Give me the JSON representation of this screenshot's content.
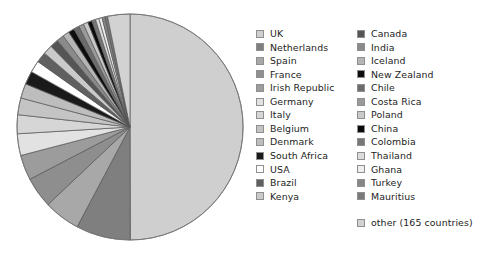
{
  "chart_data": {
    "type": "pie",
    "title": "",
    "subtitle": "",
    "xlabel": "",
    "ylabel": "",
    "grid": false,
    "legend_position": "right",
    "legend_columns": 2,
    "start_angle_deg": 0,
    "direction": "clockwise",
    "note": "Grayscale pie of visitor/export share by country. UK dominates at roughly half the circle; remaining countries fan counter-clockwise as progressively thinner slices.",
    "categories": [
      "UK",
      "Netherlands",
      "Spain",
      "France",
      "Irish Republic",
      "Germany",
      "Italy",
      "Belgium",
      "Denmark",
      "South Africa",
      "USA",
      "Brazil",
      "Kenya",
      "Canada",
      "India",
      "Iceland",
      "New Zealand",
      "Chile",
      "Costa Rica",
      "Poland",
      "China",
      "Colombia",
      "Thailand",
      "Ghana",
      "Turkey",
      "Mauritius",
      "other (165 countries)"
    ],
    "values": [
      50.0,
      7.8,
      5.2,
      4.4,
      3.6,
      3.1,
      2.7,
      2.4,
      2.1,
      1.9,
      1.7,
      1.5,
      1.35,
      1.2,
      1.05,
      0.95,
      0.85,
      0.8,
      0.72,
      0.66,
      0.6,
      0.55,
      0.5,
      0.46,
      0.42,
      0.38,
      3.19
    ],
    "colors": [
      "#cfcfcf",
      "#7f7f7f",
      "#a8a8a8",
      "#8e8e8e",
      "#9c9c9c",
      "#e2e2e2",
      "#d6d6d6",
      "#c4c4c4",
      "#bdbdbd",
      "#1a1a1a",
      "#ffffff",
      "#606060",
      "#cacaca",
      "#555555",
      "#8a8a8a",
      "#b5b5b5",
      "#0d0d0d",
      "#6b6b6b",
      "#9a9a9a",
      "#c9c9c9",
      "#0a0a0a",
      "#777777",
      "#dcdcdc",
      "#eeeeee",
      "#868686",
      "#7a7a7a",
      "#d2d2d2"
    ],
    "slice_border": "#555555",
    "legend_swatch_border": "#8f8f8f",
    "legend_text_color": "#1d1d1d",
    "background": "#ffffff"
  },
  "legend": {
    "column_1": [
      {
        "label": "UK",
        "color": "#cfcfcf"
      },
      {
        "label": "Netherlands",
        "color": "#7f7f7f"
      },
      {
        "label": "Spain",
        "color": "#a8a8a8"
      },
      {
        "label": "France",
        "color": "#8e8e8e"
      },
      {
        "label": "Irish Republic",
        "color": "#9c9c9c"
      },
      {
        "label": "Germany",
        "color": "#e2e2e2"
      },
      {
        "label": "Italy",
        "color": "#d6d6d6"
      },
      {
        "label": "Belgium",
        "color": "#c4c4c4"
      },
      {
        "label": "Denmark",
        "color": "#bdbdbd"
      },
      {
        "label": "South Africa",
        "color": "#1a1a1a"
      },
      {
        "label": "USA",
        "color": "#ffffff"
      },
      {
        "label": "Brazil",
        "color": "#606060"
      },
      {
        "label": "Kenya",
        "color": "#cacaca"
      }
    ],
    "column_2": [
      {
        "label": "Canada",
        "color": "#555555"
      },
      {
        "label": "India",
        "color": "#8a8a8a"
      },
      {
        "label": "Iceland",
        "color": "#b5b5b5"
      },
      {
        "label": "New Zealand",
        "color": "#0d0d0d"
      },
      {
        "label": "Chile",
        "color": "#6b6b6b"
      },
      {
        "label": "Costa Rica",
        "color": "#9a9a9a"
      },
      {
        "label": "Poland",
        "color": "#c9c9c9"
      },
      {
        "label": "China",
        "color": "#0a0a0a"
      },
      {
        "label": "Colombia",
        "color": "#777777"
      },
      {
        "label": "Thailand",
        "color": "#dcdcdc"
      },
      {
        "label": "Ghana",
        "color": "#eeeeee"
      },
      {
        "label": "Turkey",
        "color": "#868686"
      },
      {
        "label": "Mauritius",
        "color": "#7a7a7a"
      }
    ],
    "other": {
      "label": "other (165 countries)",
      "color": "#d2d2d2"
    }
  }
}
